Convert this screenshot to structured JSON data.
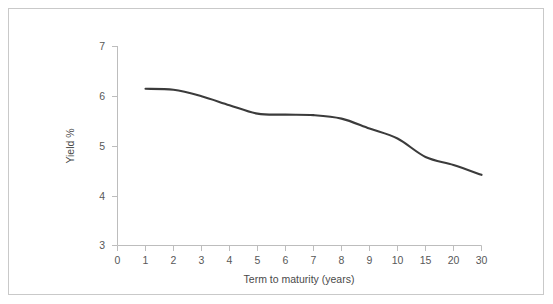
{
  "chart_data": {
    "type": "line",
    "title": "",
    "xlabel": "Term to maturity (years)",
    "ylabel": "Yield %",
    "categories": [
      "1",
      "2",
      "3",
      "4",
      "5",
      "6",
      "7",
      "8",
      "9",
      "10",
      "15",
      "20",
      "30"
    ],
    "x_tick_labels": [
      "0",
      "1",
      "2",
      "3",
      "4",
      "5",
      "6",
      "7",
      "8",
      "9",
      "10",
      "15",
      "20",
      "30"
    ],
    "y_tick_labels": [
      "3",
      "4",
      "5",
      "6",
      "7"
    ],
    "ylim": [
      3,
      7
    ],
    "values": [
      6.15,
      6.13,
      6.0,
      5.82,
      5.65,
      5.63,
      5.62,
      5.55,
      5.35,
      5.15,
      4.78,
      4.62,
      4.42
    ],
    "series": [
      {
        "name": "Yield curve",
        "values": [
          6.15,
          6.13,
          6.0,
          5.82,
          5.65,
          5.63,
          5.62,
          5.55,
          5.35,
          5.15,
          4.78,
          4.62,
          4.42
        ]
      }
    ],
    "grid": false,
    "legend": "none",
    "line_color": "#3b3b3b",
    "axis_color": "#bdbdbd",
    "border_color": "#c9c9c9"
  }
}
